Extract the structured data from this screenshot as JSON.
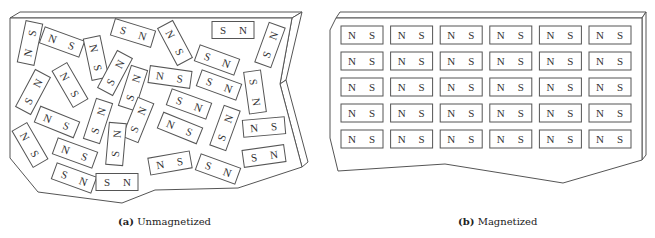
{
  "panels": {
    "a": {
      "caption_letter": "(a)",
      "caption_text": "Unmagnetized",
      "magnets": [
        {
          "cx": 30,
          "cy": 43,
          "a": -78,
          "l": "N",
          "r": "S"
        },
        {
          "cx": 62,
          "cy": 42,
          "a": 20,
          "l": "N",
          "r": "S"
        },
        {
          "cx": 96,
          "cy": 58,
          "a": 78,
          "l": "N",
          "r": "S"
        },
        {
          "cx": 133,
          "cy": 33,
          "a": 17,
          "l": "S",
          "r": "N"
        },
        {
          "cx": 175,
          "cy": 43,
          "a": 62,
          "l": "N",
          "r": "S"
        },
        {
          "cx": 233,
          "cy": 30,
          "a": 0,
          "l": "S",
          "r": "N"
        },
        {
          "cx": 270,
          "cy": 45,
          "a": -70,
          "l": "S",
          "r": "N"
        },
        {
          "cx": 217,
          "cy": 60,
          "a": 20,
          "l": "S",
          "r": "N"
        },
        {
          "cx": 33,
          "cy": 92,
          "a": -62,
          "l": "S",
          "r": "N"
        },
        {
          "cx": 70,
          "cy": 85,
          "a": 60,
          "l": "N",
          "r": "S"
        },
        {
          "cx": 115,
          "cy": 73,
          "a": -62,
          "l": "S",
          "r": "N"
        },
        {
          "cx": 133,
          "cy": 88,
          "a": -72,
          "l": "S",
          "r": "N"
        },
        {
          "cx": 170,
          "cy": 77,
          "a": 8,
          "l": "N",
          "r": "S"
        },
        {
          "cx": 219,
          "cy": 85,
          "a": 20,
          "l": "S",
          "r": "N"
        },
        {
          "cx": 255,
          "cy": 92,
          "a": 82,
          "l": "S",
          "r": "N"
        },
        {
          "cx": 189,
          "cy": 104,
          "a": 20,
          "l": "S",
          "r": "N"
        },
        {
          "cx": 57,
          "cy": 122,
          "a": 22,
          "l": "N",
          "r": "S"
        },
        {
          "cx": 98,
          "cy": 121,
          "a": -72,
          "l": "S",
          "r": "N"
        },
        {
          "cx": 138,
          "cy": 120,
          "a": -68,
          "l": "S",
          "r": "N"
        },
        {
          "cx": 180,
          "cy": 128,
          "a": 22,
          "l": "N",
          "r": "S"
        },
        {
          "cx": 225,
          "cy": 128,
          "a": -70,
          "l": "S",
          "r": "N"
        },
        {
          "cx": 264,
          "cy": 127,
          "a": -5,
          "l": "N",
          "r": "S"
        },
        {
          "cx": 30,
          "cy": 145,
          "a": 60,
          "l": "N",
          "r": "S"
        },
        {
          "cx": 75,
          "cy": 153,
          "a": 20,
          "l": "N",
          "r": "S"
        },
        {
          "cx": 116,
          "cy": 144,
          "a": -85,
          "l": "S",
          "r": "N"
        },
        {
          "cx": 74,
          "cy": 178,
          "a": 20,
          "l": "S",
          "r": "N"
        },
        {
          "cx": 117,
          "cy": 182,
          "a": 0,
          "l": "S",
          "r": "N"
        },
        {
          "cx": 170,
          "cy": 163,
          "a": -10,
          "l": "N",
          "r": "S"
        },
        {
          "cx": 218,
          "cy": 169,
          "a": 20,
          "l": "S",
          "r": "N"
        },
        {
          "cx": 264,
          "cy": 156,
          "a": -8,
          "l": "S",
          "r": "N"
        }
      ]
    },
    "b": {
      "caption_letter": "(b)",
      "caption_text": "Magnetized",
      "rows": 5,
      "cols": 6,
      "left_label": "N",
      "right_label": "S"
    }
  }
}
